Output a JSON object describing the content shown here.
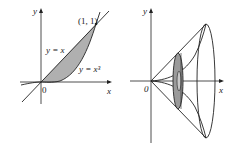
{
  "figures": [
    {
      "id": "region",
      "axes": {
        "x_label": "x",
        "y_label": "y",
        "origin_label": "0"
      },
      "curves": [
        {
          "label": "y = x",
          "equation": "y = x"
        },
        {
          "label": "y = x³",
          "equation": "y = x^3"
        }
      ],
      "point_label": "(1, 1)",
      "shaded_region": "between y = x and y = x^3 for 0 ≤ x ≤ 1",
      "colors": {
        "fill": "#b0b0b0",
        "stroke": "#222222"
      }
    },
    {
      "id": "solid-of-revolution",
      "axes": {
        "x_label": "x",
        "y_label": "y",
        "origin_label": "0"
      },
      "description": "Region rotated about the x-axis forming a cone with an inner cubic horn; a shaded washer cross-section is shown",
      "colors": {
        "washer_fill": "#9a9a9a",
        "stroke": "#222222"
      }
    }
  ]
}
